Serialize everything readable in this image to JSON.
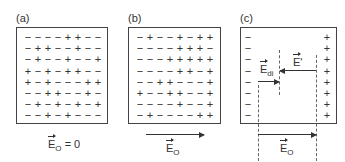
{
  "panels": [
    {
      "label": "(a)",
      "field_label": "E",
      "field_sub": "O",
      "field_suffix": " = 0",
      "grid": [
        [
          "−",
          "−",
          "−",
          "−",
          "+",
          "+",
          "−",
          "−"
        ],
        [
          "−",
          "+",
          "+",
          "−",
          "−",
          "+",
          "−",
          "−"
        ],
        [
          "−",
          "+",
          "−",
          "−",
          "+",
          "−",
          "−",
          "+"
        ],
        [
          "+",
          "−",
          "+",
          "−",
          "+",
          "+",
          "−",
          "−"
        ],
        [
          "+",
          "−",
          "+",
          "−",
          "−",
          "−",
          "+",
          "+"
        ],
        [
          "−",
          "−",
          "+",
          "+",
          "−",
          "−",
          "+",
          "−"
        ],
        [
          "−",
          "+",
          "−",
          "+",
          "−",
          "+",
          "−",
          "+"
        ],
        [
          "−",
          "−",
          "+",
          "−",
          "+",
          "−",
          "−",
          "−"
        ]
      ]
    },
    {
      "label": "(b)",
      "field_label": "E",
      "field_sub": "O",
      "grid": [
        [
          "−",
          "+",
          "−",
          "−",
          "+",
          "−",
          "+",
          "+"
        ],
        [
          "−",
          "−",
          "−",
          "−",
          "+",
          "+",
          "+",
          "−"
        ],
        [
          "−",
          "−",
          "−",
          "+",
          "+",
          "+",
          "+",
          "+"
        ],
        [
          "−",
          "−",
          "−",
          "−",
          "+",
          "+",
          "−",
          "+"
        ],
        [
          "−",
          "−",
          "+",
          "+",
          "−",
          "−",
          "−",
          "+"
        ],
        [
          "+",
          "−",
          "−",
          "+",
          "+",
          "−",
          "−",
          "+"
        ],
        [
          "−",
          "−",
          "−",
          "−",
          "+",
          "−",
          "−",
          "+"
        ],
        [
          "−",
          "+",
          "−",
          "−",
          "−",
          "−",
          "+",
          "+"
        ]
      ]
    },
    {
      "label": "(c)",
      "left_charges": [
        "−",
        "−",
        "−",
        "−",
        "−",
        "−",
        "−",
        "−"
      ],
      "right_charges": [
        "+",
        "+",
        "+",
        "+",
        "+",
        "+",
        "+",
        "+"
      ],
      "e_di_label": "E",
      "e_di_sub": "di",
      "e_prime_label": "E",
      "e_prime_suffix": "'",
      "field_label": "E",
      "field_sub": "O"
    }
  ]
}
